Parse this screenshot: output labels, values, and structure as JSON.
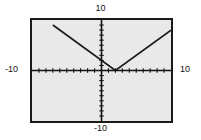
{
  "labels": {
    "top": "10",
    "bottom": "-10",
    "left": "-10",
    "right": "10"
  },
  "colors": {
    "plot_background": "#e9e9e9",
    "frame_border": "#1a1a1a",
    "axis": "#111111",
    "curve": "#1a1a1a",
    "page_background": "#ffffff",
    "label_text": "#111111"
  },
  "chart_data": {
    "type": "line",
    "title": "",
    "xlabel": "",
    "ylabel": "",
    "xlim": [
      -10,
      10
    ],
    "ylim": [
      -10,
      10
    ],
    "grid": false,
    "axis_ticks": {
      "x_tick_interval": 1,
      "y_tick_interval": 1,
      "x_tick_values": [
        -9,
        -8,
        -7,
        -6,
        -5,
        -4,
        -3,
        -2,
        -1,
        1,
        2,
        3,
        4,
        5,
        6,
        7,
        8,
        9
      ],
      "y_tick_values": [
        -9,
        -8,
        -7,
        -6,
        -5,
        -4,
        -3,
        -2,
        -1,
        1,
        2,
        3,
        4,
        5,
        6,
        7,
        8,
        9
      ]
    },
    "tick_labels": {
      "top": "10",
      "bottom": "-10",
      "left": "-10",
      "right": "10"
    },
    "legend": [],
    "annotations": [],
    "series": [
      {
        "name": "absolute-value",
        "vertex": [
          2,
          0
        ],
        "left_slope": -1,
        "right_slope": 1,
        "x": [
          -7,
          2,
          10
        ],
        "values": [
          9,
          0,
          8
        ]
      }
    ]
  }
}
